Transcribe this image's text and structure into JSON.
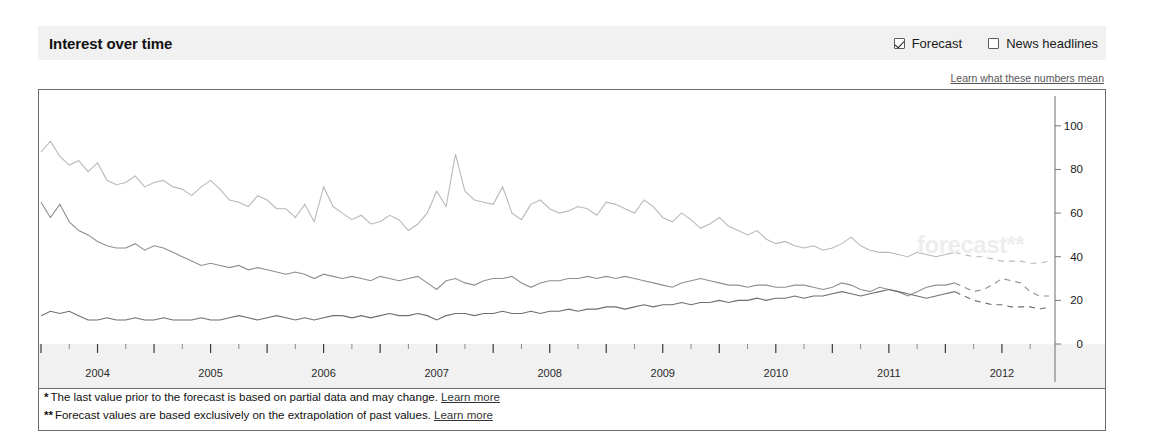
{
  "panel": {
    "title": "Interest over time"
  },
  "controls": {
    "forecast": {
      "label": "Forecast",
      "checked": true
    },
    "news": {
      "label": "News headlines",
      "checked": false
    }
  },
  "links": {
    "learn_numbers": "Learn what these numbers mean",
    "learn_more": "Learn more"
  },
  "footnotes": {
    "one_marker": "*",
    "one_text": "The last value prior to the forecast is based on partial data and may change.",
    "two_marker": "**",
    "two_text": "Forecast values are based exclusively on the extrapolation of past values."
  },
  "watermark": "forecast**",
  "chart_data": {
    "type": "line",
    "title": "Interest over time",
    "xlabel": "",
    "ylabel": "",
    "ylim": [
      0,
      110
    ],
    "yticks": [
      0,
      20,
      40,
      60,
      80,
      100
    ],
    "grid": false,
    "legend": "none",
    "xticklabels": [
      "2004",
      "2005",
      "2006",
      "2007",
      "2008",
      "2009",
      "2010",
      "2011",
      "2012"
    ],
    "x_start": "2004-01",
    "x_end": "2012-12",
    "forecast_start_index": 97,
    "series": [
      {
        "name": "series-1",
        "color": "#b9b9b9",
        "values": [
          88,
          93,
          86,
          82,
          84,
          79,
          83,
          75,
          73,
          74,
          77,
          72,
          74,
          75,
          72,
          71,
          68,
          72,
          75,
          71,
          66,
          65,
          63,
          68,
          66,
          62,
          62,
          58,
          64,
          56,
          72,
          63,
          60,
          57,
          59,
          55,
          56,
          59,
          57,
          52,
          55,
          60,
          70,
          63,
          87,
          70,
          66,
          65,
          64,
          72,
          60,
          57,
          64,
          66,
          62,
          60,
          61,
          63,
          62,
          59,
          65,
          64,
          62,
          60,
          66,
          63,
          58,
          56,
          60,
          57,
          53,
          55,
          58,
          54,
          52,
          50,
          52,
          48,
          46,
          47,
          45,
          44,
          45,
          43,
          44,
          46,
          49,
          45,
          43,
          42,
          42,
          41,
          40,
          42,
          41,
          40,
          41,
          42,
          41,
          40,
          40,
          39,
          38,
          38,
          38,
          37,
          37,
          38
        ]
      },
      {
        "name": "series-2",
        "color": "#8f8f8f",
        "values": [
          65,
          58,
          64,
          56,
          52,
          50,
          47,
          45,
          44,
          44,
          46,
          43,
          45,
          44,
          42,
          40,
          38,
          36,
          37,
          36,
          35,
          36,
          34,
          35,
          34,
          33,
          32,
          33,
          32,
          30,
          32,
          31,
          30,
          31,
          30,
          29,
          31,
          30,
          29,
          30,
          31,
          28,
          25,
          29,
          30,
          28,
          27,
          29,
          30,
          30,
          31,
          28,
          26,
          28,
          29,
          29,
          30,
          30,
          31,
          30,
          31,
          30,
          31,
          30,
          29,
          28,
          27,
          26,
          28,
          29,
          30,
          29,
          28,
          27,
          27,
          26,
          27,
          27,
          26,
          26,
          27,
          27,
          26,
          25,
          26,
          28,
          27,
          25,
          24,
          26,
          25,
          24,
          22,
          24,
          26,
          27,
          27,
          28,
          26,
          24,
          25,
          27,
          30,
          29,
          28,
          24,
          22,
          22
        ]
      },
      {
        "name": "series-3",
        "color": "#6e6e6e",
        "values": [
          13,
          15,
          14,
          15,
          13,
          11,
          11,
          12,
          11,
          11,
          12,
          11,
          11,
          12,
          11,
          11,
          11,
          12,
          11,
          11,
          12,
          13,
          12,
          11,
          12,
          13,
          12,
          11,
          12,
          11,
          12,
          13,
          13,
          12,
          13,
          12,
          13,
          14,
          13,
          13,
          14,
          13,
          11,
          13,
          14,
          14,
          13,
          14,
          14,
          15,
          14,
          14,
          15,
          14,
          15,
          15,
          16,
          15,
          16,
          16,
          17,
          17,
          16,
          17,
          18,
          17,
          18,
          18,
          19,
          18,
          19,
          19,
          20,
          19,
          20,
          20,
          21,
          20,
          21,
          21,
          22,
          21,
          22,
          22,
          23,
          24,
          23,
          22,
          23,
          24,
          25,
          24,
          23,
          22,
          21,
          22,
          23,
          24,
          22,
          20,
          19,
          18,
          18,
          17,
          17,
          17,
          16,
          17
        ]
      }
    ]
  }
}
